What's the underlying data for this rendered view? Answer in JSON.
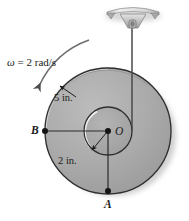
{
  "figure": {
    "name": "rotating-disc-suspended-by-cord",
    "width": 189,
    "height": 221,
    "background": "#ffffff"
  },
  "annotations": {
    "angular_velocity": {
      "symbol": "ω",
      "equals": "=",
      "value": "2",
      "unit": "rad/s",
      "full": "ω = 2 rad/s",
      "direction": "counterclockwise"
    },
    "outer_radius": "5 in.",
    "inner_radius": "2 in.",
    "point_o": "O",
    "point_a": "A",
    "point_b": "B"
  },
  "geometry": {
    "center": {
      "x": 108,
      "y": 131
    },
    "outer_circle_radius": 63,
    "inner_circle_radius": 24,
    "point_b": {
      "x": 45,
      "y": 131
    },
    "point_a": {
      "x": 108,
      "y": 192
    },
    "cord_x": 132,
    "bracket": {
      "x": 132,
      "y": 8
    }
  },
  "colors": {
    "disc_fill": "#a9a9a9",
    "inner_fill": "#a3a3a3",
    "outline": "#2b2b2b",
    "highlight": "#f2f2f2",
    "shadow": "#8c8c8c",
    "bracket_body": "#b5b5b5",
    "bracket_top": "#d8d8d8",
    "cord": "#4a4a4a",
    "label_text": "#1a1a1a"
  }
}
